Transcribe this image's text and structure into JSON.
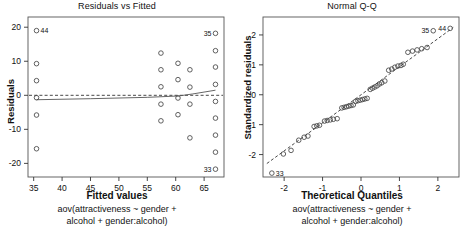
{
  "figure": {
    "type": "diagnostic-plots",
    "panels": 2
  },
  "left": {
    "title": "Residuals vs Fitted",
    "xlabel": "Fitted values",
    "ylabel": "Residuals",
    "caption_line1": "aov(attractiveness ~ gender +",
    "caption_line2": "alcohol + gender:alcohol)"
  },
  "right": {
    "title": "Normal Q-Q",
    "xlabel": "Theoretical Quantiles",
    "ylabel": "Standardized residuals",
    "caption_line1": "aov(attractiveness ~ gender +",
    "caption_line2": "alcohol + gender:alcohol)"
  },
  "chart_data": [
    {
      "type": "scatter",
      "title": "Residuals vs Fitted",
      "xlabel": "Fitted values",
      "ylabel": "Residuals",
      "xlim": [
        34.0,
        68.5
      ],
      "ylim": [
        -24.0,
        23.0
      ],
      "xticks": [
        35,
        40,
        45,
        50,
        55,
        60,
        65
      ],
      "yticks": [
        -20,
        -10,
        0,
        10,
        20
      ],
      "grid": false,
      "legend": null,
      "reference_line": {
        "type": "horizontal-dashed",
        "y": 0
      },
      "smoother": {
        "type": "lowess-solid",
        "x": [
          35.5,
          45.0,
          55.0,
          60.5,
          63.0,
          67.0
        ],
        "y": [
          -1.3,
          -1.0,
          -0.6,
          -0.2,
          0.4,
          1.5
        ]
      },
      "points": [
        {
          "x": 35.5,
          "y": 19.0,
          "label": "44"
        },
        {
          "x": 35.5,
          "y": 9.3,
          "label": ""
        },
        {
          "x": 35.5,
          "y": 4.3,
          "label": ""
        },
        {
          "x": 35.5,
          "y": -0.7,
          "label": ""
        },
        {
          "x": 35.5,
          "y": -5.8,
          "label": ""
        },
        {
          "x": 35.5,
          "y": -15.7,
          "label": ""
        },
        {
          "x": 57.4,
          "y": 12.4,
          "label": ""
        },
        {
          "x": 57.4,
          "y": 7.5,
          "label": ""
        },
        {
          "x": 57.4,
          "y": 2.5,
          "label": ""
        },
        {
          "x": 57.4,
          "y": -2.6,
          "label": ""
        },
        {
          "x": 57.4,
          "y": -7.5,
          "label": ""
        },
        {
          "x": 60.4,
          "y": 9.4,
          "label": ""
        },
        {
          "x": 60.4,
          "y": 4.6,
          "label": ""
        },
        {
          "x": 60.4,
          "y": -0.8,
          "label": ""
        },
        {
          "x": 60.4,
          "y": -5.7,
          "label": ""
        },
        {
          "x": 62.5,
          "y": 7.5,
          "label": ""
        },
        {
          "x": 62.5,
          "y": 2.4,
          "label": ""
        },
        {
          "x": 62.5,
          "y": -2.6,
          "label": ""
        },
        {
          "x": 62.5,
          "y": -12.5,
          "label": ""
        },
        {
          "x": 67.0,
          "y": 18.2,
          "label": "35"
        },
        {
          "x": 67.0,
          "y": 13.1,
          "label": ""
        },
        {
          "x": 67.0,
          "y": 8.3,
          "label": ""
        },
        {
          "x": 67.0,
          "y": 3.2,
          "label": ""
        },
        {
          "x": 67.0,
          "y": -1.8,
          "label": ""
        },
        {
          "x": 67.0,
          "y": -6.7,
          "label": ""
        },
        {
          "x": 67.0,
          "y": -11.7,
          "label": ""
        },
        {
          "x": 67.0,
          "y": -16.7,
          "label": ""
        },
        {
          "x": 67.0,
          "y": -21.7,
          "label": "33"
        }
      ]
    },
    {
      "type": "scatter",
      "title": "Normal Q-Q",
      "xlabel": "Theoretical Quantiles",
      "ylabel": "Standardized residuals",
      "xlim": [
        -2.55,
        2.55
      ],
      "ylim": [
        -2.75,
        2.6
      ],
      "xticks": [
        -2,
        -1,
        0,
        1,
        2
      ],
      "yticks": [
        -2,
        -1,
        0,
        1,
        2
      ],
      "grid": false,
      "legend": null,
      "reference_line": {
        "type": "qq-dashed",
        "x": [
          -2.45,
          2.4
        ],
        "y": [
          -2.3,
          2.25
        ]
      },
      "points": [
        {
          "x": -2.32,
          "y": -2.62,
          "label": "33"
        },
        {
          "x": -2.02,
          "y": -1.98,
          "label": ""
        },
        {
          "x": -1.82,
          "y": -1.86,
          "label": ""
        },
        {
          "x": -1.62,
          "y": -1.52,
          "label": ""
        },
        {
          "x": -1.48,
          "y": -1.42,
          "label": ""
        },
        {
          "x": -1.38,
          "y": -1.38,
          "label": ""
        },
        {
          "x": -1.22,
          "y": -1.06,
          "label": ""
        },
        {
          "x": -1.15,
          "y": -1.04,
          "label": ""
        },
        {
          "x": -1.08,
          "y": -1.02,
          "label": ""
        },
        {
          "x": -0.95,
          "y": -0.88,
          "label": ""
        },
        {
          "x": -0.88,
          "y": -0.86,
          "label": ""
        },
        {
          "x": -0.8,
          "y": -0.84,
          "label": ""
        },
        {
          "x": -0.72,
          "y": -0.82,
          "label": ""
        },
        {
          "x": -0.62,
          "y": -0.8,
          "label": ""
        },
        {
          "x": -0.5,
          "y": -0.44,
          "label": ""
        },
        {
          "x": -0.44,
          "y": -0.42,
          "label": ""
        },
        {
          "x": -0.38,
          "y": -0.4,
          "label": ""
        },
        {
          "x": -0.32,
          "y": -0.38,
          "label": ""
        },
        {
          "x": -0.26,
          "y": -0.36,
          "label": ""
        },
        {
          "x": -0.2,
          "y": -0.34,
          "label": ""
        },
        {
          "x": -0.14,
          "y": -0.22,
          "label": ""
        },
        {
          "x": -0.08,
          "y": -0.2,
          "label": ""
        },
        {
          "x": -0.02,
          "y": -0.18,
          "label": ""
        },
        {
          "x": 0.04,
          "y": -0.16,
          "label": ""
        },
        {
          "x": 0.1,
          "y": -0.14,
          "label": ""
        },
        {
          "x": 0.16,
          "y": -0.12,
          "label": ""
        },
        {
          "x": 0.24,
          "y": 0.18,
          "label": ""
        },
        {
          "x": 0.3,
          "y": 0.22,
          "label": ""
        },
        {
          "x": 0.36,
          "y": 0.26,
          "label": ""
        },
        {
          "x": 0.42,
          "y": 0.3,
          "label": ""
        },
        {
          "x": 0.48,
          "y": 0.36,
          "label": ""
        },
        {
          "x": 0.54,
          "y": 0.4,
          "label": ""
        },
        {
          "x": 0.62,
          "y": 0.46,
          "label": ""
        },
        {
          "x": 0.72,
          "y": 0.82,
          "label": ""
        },
        {
          "x": 0.8,
          "y": 0.86,
          "label": ""
        },
        {
          "x": 0.88,
          "y": 0.92,
          "label": ""
        },
        {
          "x": 0.96,
          "y": 0.96,
          "label": ""
        },
        {
          "x": 1.04,
          "y": 0.98,
          "label": ""
        },
        {
          "x": 1.1,
          "y": 1.02,
          "label": ""
        },
        {
          "x": 1.22,
          "y": 1.42,
          "label": ""
        },
        {
          "x": 1.34,
          "y": 1.46,
          "label": ""
        },
        {
          "x": 1.46,
          "y": 1.5,
          "label": ""
        },
        {
          "x": 1.58,
          "y": 1.54,
          "label": ""
        },
        {
          "x": 1.72,
          "y": 1.58,
          "label": ""
        },
        {
          "x": 1.88,
          "y": 2.14,
          "label": "35"
        },
        {
          "x": 2.32,
          "y": 2.22,
          "label": "44"
        }
      ]
    }
  ]
}
